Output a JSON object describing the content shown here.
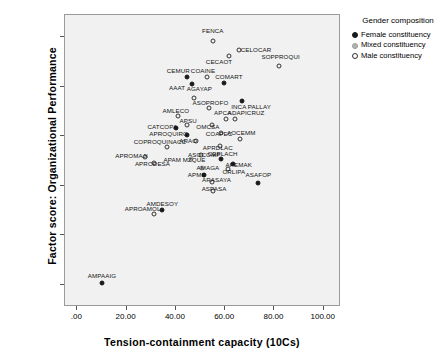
{
  "chart_data": {
    "type": "scatter",
    "title": "",
    "xlabel": "Tension-containment capacity (10Cs)",
    "ylabel": "Factor score: Organizational Performance",
    "xlim": [
      -5,
      107
    ],
    "ylim": [
      -3.45,
      2.45
    ],
    "xticks": [
      ".00",
      "20.00",
      "40.00",
      "60.00",
      "80.00",
      "100.00"
    ],
    "xtickvalues": [
      0,
      20,
      40,
      60,
      80,
      100
    ],
    "yticks": [
      "2.00000",
      "1.00000",
      ".00000",
      "-1.00000",
      "-2.00000",
      "-3.00000"
    ],
    "ytickvalues": [
      2,
      1,
      0,
      -1,
      -2,
      -3
    ],
    "grid": false,
    "legend": {
      "title": "Gender composition",
      "position": "right",
      "entries": [
        {
          "label": "Female constituency",
          "marker": "female",
          "color": "#1a1a1a"
        },
        {
          "label": "Mixed constituency",
          "marker": "mixed",
          "color": "#b3b3b3"
        },
        {
          "label": "Male constituency",
          "marker": "male",
          "color": "#ffffff"
        }
      ]
    },
    "points": [
      {
        "label": "FENCA",
        "x": 55.0,
        "y": 1.92,
        "group": "male",
        "lx": 55.0,
        "ly": 2.14
      },
      {
        "label": "CECAOT",
        "x": 61.5,
        "y": 1.62,
        "group": "male",
        "lx": 57.5,
        "ly": 1.52
      },
      {
        "label": "CELOCAR",
        "x": 65.5,
        "y": 1.74,
        "group": "male",
        "lx": 72.5,
        "ly": 1.76
      },
      {
        "label": "SOPPROQUI",
        "x": 82.0,
        "y": 1.42,
        "group": "male",
        "lx": 82.5,
        "ly": 1.62
      },
      {
        "label": "CEMUR",
        "x": 44.5,
        "y": 1.2,
        "group": "female",
        "lx": 41.0,
        "ly": 1.33
      },
      {
        "label": "COAINE",
        "x": 52.5,
        "y": 1.19,
        "group": "male",
        "lx": 51.0,
        "ly": 1.33
      },
      {
        "label": "COMART",
        "x": 59.5,
        "y": 1.08,
        "group": "female",
        "lx": 61.5,
        "ly": 1.21
      },
      {
        "label": "AAAT",
        "x": 46.5,
        "y": 1.05,
        "group": "female",
        "lx": 40.5,
        "ly": 0.99
      },
      {
        "label": "AGAYAP",
        "x": 47.5,
        "y": 0.78,
        "group": "male",
        "lx": 49.5,
        "ly": 0.97
      },
      {
        "label": "ASOPROFO",
        "x": 53.5,
        "y": 0.57,
        "group": "male",
        "lx": 54.0,
        "ly": 0.7
      },
      {
        "label": "INCA PALLAY",
        "x": 67.0,
        "y": 0.71,
        "group": "female",
        "lx": 70.5,
        "ly": 0.62
      },
      {
        "label": "AMLECO",
        "x": 41.0,
        "y": 0.4,
        "group": "male",
        "lx": 40.0,
        "ly": 0.54
      },
      {
        "label": "APCA",
        "x": 60.5,
        "y": 0.35,
        "group": "male",
        "lx": 59.0,
        "ly": 0.5
      },
      {
        "label": "ADAPICRUZ",
        "x": 64.0,
        "y": 0.35,
        "group": "male",
        "lx": 68.5,
        "ly": 0.5
      },
      {
        "label": "APSU",
        "x": 44.5,
        "y": 0.22,
        "group": "male",
        "lx": 45.0,
        "ly": 0.32
      },
      {
        "label": "CATCOPA",
        "x": 40.0,
        "y": 0.17,
        "group": "female",
        "lx": 34.5,
        "ly": 0.2
      },
      {
        "label": "OMCSA",
        "x": 54.5,
        "y": 0.22,
        "group": "male",
        "lx": 53.0,
        "ly": 0.21
      },
      {
        "label": "COAPEC",
        "x": 58.5,
        "y": 0.06,
        "group": "male",
        "lx": 57.5,
        "ly": 0.06
      },
      {
        "label": "APROQUIRC",
        "x": 44.5,
        "y": 0.03,
        "group": "female",
        "lx": 37.0,
        "ly": 0.07
      },
      {
        "label": "AOCEMM",
        "x": 66.0,
        "y": -0.06,
        "group": "male",
        "lx": 66.5,
        "ly": 0.09
      },
      {
        "label": "ARAO",
        "x": 48.0,
        "y": -0.1,
        "group": "male",
        "lx": 45.0,
        "ly": -0.08
      },
      {
        "label": "COPROQUINACC",
        "x": 36.5,
        "y": -0.22,
        "group": "male",
        "lx": 33.5,
        "ly": -0.09
      },
      {
        "label": "APRDLAC",
        "x": 58.0,
        "y": -0.2,
        "group": "male",
        "lx": 57.0,
        "ly": -0.21
      },
      {
        "label": "ASOCOMP",
        "x": 50.0,
        "y": -0.37,
        "group": "male",
        "lx": 51.5,
        "ly": -0.35
      },
      {
        "label": "CEPLACH",
        "x": 58.5,
        "y": -0.45,
        "group": "female",
        "lx": 59.0,
        "ly": -0.33
      },
      {
        "label": "APROMAJI",
        "x": 27.5,
        "y": -0.42,
        "group": "male",
        "lx": 22.0,
        "ly": -0.37
      },
      {
        "label": "APAM MZQUE",
        "x": 46.0,
        "y": -0.46,
        "group": "mixed",
        "lx": 43.5,
        "ly": -0.46
      },
      {
        "label": "APRODESA",
        "x": 31.0,
        "y": -0.55,
        "group": "male",
        "lx": 30.5,
        "ly": -0.55
      },
      {
        "label": "APEMAK",
        "x": 63.0,
        "y": -0.56,
        "group": "female",
        "lx": 65.5,
        "ly": -0.56
      },
      {
        "label": "AMAGA",
        "x": 50.5,
        "y": -0.64,
        "group": "mixed",
        "lx": 53.0,
        "ly": -0.62
      },
      {
        "label": "ORLIPA",
        "x": 61.0,
        "y": -0.67,
        "group": "male",
        "lx": 63.5,
        "ly": -0.7
      },
      {
        "label": "APME",
        "x": 51.5,
        "y": -0.78,
        "group": "female",
        "lx": 48.5,
        "ly": -0.76
      },
      {
        "label": "ASAFOP",
        "x": 73.5,
        "y": -0.94,
        "group": "female",
        "lx": 73.5,
        "ly": -0.76
      },
      {
        "label": "ARASAYA",
        "x": 54.5,
        "y": -0.92,
        "group": "male",
        "lx": 56.5,
        "ly": -0.86
      },
      {
        "label": "ASPASA",
        "x": 55.0,
        "y": -1.1,
        "group": "male",
        "lx": 55.5,
        "ly": -1.05
      },
      {
        "label": "AMDESOY",
        "x": 34.5,
        "y": -1.5,
        "group": "female",
        "lx": 34.5,
        "ly": -1.35
      },
      {
        "label": "APROAMOL",
        "x": 31.0,
        "y": -1.58,
        "group": "male",
        "lx": 26.5,
        "ly": -1.44
      },
      {
        "label": "AMPAAIG",
        "x": 10.0,
        "y": -2.97,
        "group": "female",
        "lx": 10.0,
        "ly": -2.8
      }
    ]
  }
}
